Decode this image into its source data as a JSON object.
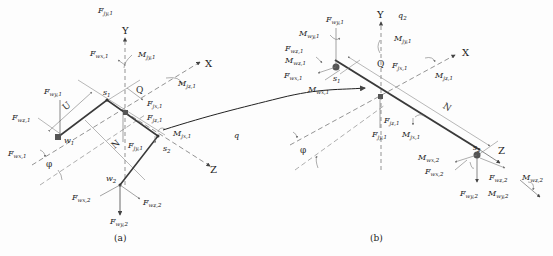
{
  "panel_a": {
    "caption": "(a)",
    "axes": {
      "x": "X",
      "y": "Y",
      "z": "Z"
    },
    "nodes": {
      "s1": "s",
      "s1_sub": "1",
      "s2": "s",
      "s2_sub": "2",
      "w1": "w",
      "w1_sub": "1",
      "w2": "w",
      "w2_sub": "2"
    },
    "dims": {
      "U": "U",
      "N": "N",
      "Q": "Q",
      "phi": "φ"
    },
    "labels": {
      "Fjy1_top": {
        "main": "F",
        "sub": "jy,1"
      },
      "Fwx1_top": {
        "main": "F",
        "sub": "wx,1"
      },
      "Mjy1": {
        "main": "M",
        "sub": "jy,1"
      },
      "Mjz1": {
        "main": "M",
        "sub": "jz,1"
      },
      "Fwy1": {
        "main": "F",
        "sub": "wy,1"
      },
      "Fwz1": {
        "main": "F",
        "sub": "wz,1"
      },
      "Fjx1": {
        "main": "F",
        "sub": "jx,1"
      },
      "Fjz1": {
        "main": "F",
        "sub": "jz,1"
      },
      "Mjx1": {
        "main": "M",
        "sub": "jx,1"
      },
      "q": {
        "main": "q",
        "sub": ""
      },
      "Fwx1_left": {
        "main": "F",
        "sub": "wx,1"
      },
      "Fjy1": {
        "main": "F",
        "sub": "jy,1"
      },
      "Fwx2": {
        "main": "F",
        "sub": "wx,2"
      },
      "Fwz2": {
        "main": "F",
        "sub": "wz,2"
      },
      "Fwy2": {
        "main": "F",
        "sub": "wy,2"
      }
    }
  },
  "panel_b": {
    "caption": "(b)",
    "axes": {
      "x": "X",
      "y": "Y",
      "z": "Z"
    },
    "nodes": {
      "s1": "s",
      "s1_sub": "1",
      "s2": "s",
      "s2_sub": "2"
    },
    "dims": {
      "N": "N",
      "Q": "Q",
      "phi": "φ"
    },
    "labels": {
      "q2": {
        "main": "q",
        "sub": "2"
      },
      "Fwy1": {
        "main": "F",
        "sub": "wy,1"
      },
      "Mwy1": {
        "main": "M",
        "sub": "wy,1"
      },
      "Mjy1": {
        "main": "M",
        "sub": "jy,1"
      },
      "Fwx1": {
        "main": "F",
        "sub": "wx,1"
      },
      "Mwx1": {
        "main": "M",
        "sub": "wx,1"
      },
      "Fjz1": {
        "main": "F",
        "sub": "jz,1"
      },
      "Mjz1": {
        "main": "M",
        "sub": "jz,1"
      },
      "Fwz1": {
        "main": "F",
        "sub": "wz,1"
      },
      "Mwz1": {
        "main": "M",
        "sub": "wz,1"
      },
      "Fjx1": {
        "main": "F",
        "sub": "jx,1"
      },
      "Fjy1": {
        "main": "F",
        "sub": "jy,1"
      },
      "Mjx1": {
        "main": "M",
        "sub": "jx,1"
      },
      "Mwx2": {
        "main": "M",
        "sub": "wx,2"
      },
      "Fwx2": {
        "main": "F",
        "sub": "wx,2"
      },
      "Fwz2": {
        "main": "F",
        "sub": "wz,2"
      },
      "Mwz2": {
        "main": "M",
        "sub": "wz,2"
      },
      "Fwy2": {
        "main": "F",
        "sub": "wy,2"
      },
      "Mwy2": {
        "main": "M",
        "sub": "wy,2"
      }
    }
  },
  "colors": {
    "line": "#333333",
    "thin": "#888888",
    "member": "#3a3a3a"
  }
}
